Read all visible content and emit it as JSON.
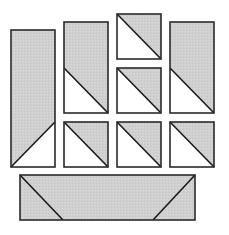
{
  "diagram": {
    "colors": {
      "shaded": "#cfcfcf",
      "light": "#ffffff",
      "stroke": "#2a2a2a"
    },
    "pieces": [
      {
        "id": "tall-rect-left",
        "x": 11,
        "y": 30,
        "w": 44,
        "h": 137,
        "shaded_poly": "11,30 55,30 55,122 11,167",
        "diag": [
          11,
          167,
          55,
          122
        ]
      },
      {
        "id": "rect-col2",
        "x": 64,
        "y": 22,
        "w": 44,
        "h": 91,
        "shaded_poly": "64,22 108,22 108,113 64,68",
        "diag": [
          64,
          68,
          108,
          113
        ]
      },
      {
        "id": "square-col3-top",
        "x": 117,
        "y": 14,
        "w": 44,
        "h": 45,
        "shaded_poly": "117,14 161,14 161,59",
        "diag": [
          117,
          14,
          161,
          59
        ]
      },
      {
        "id": "square-col3-mid",
        "x": 117,
        "y": 68,
        "w": 44,
        "h": 45,
        "shaded_poly": "117,68 161,68 161,113",
        "diag": [
          117,
          68,
          161,
          113
        ]
      },
      {
        "id": "rect-col4",
        "x": 170,
        "y": 22,
        "w": 44,
        "h": 91,
        "shaded_poly": "170,22 214,22 214,113 170,68",
        "diag": [
          170,
          68,
          214,
          113
        ]
      },
      {
        "id": "square-row3-col2",
        "x": 64,
        "y": 122,
        "w": 44,
        "h": 45,
        "shaded_poly": "64,122 108,122 108,167",
        "diag": [
          64,
          122,
          108,
          167
        ]
      },
      {
        "id": "square-row3-col3",
        "x": 117,
        "y": 122,
        "w": 44,
        "h": 45,
        "shaded_poly": "117,122 161,122 161,167",
        "diag": [
          117,
          122,
          161,
          167
        ]
      },
      {
        "id": "square-row3-col4",
        "x": 170,
        "y": 122,
        "w": 44,
        "h": 45,
        "shaded_poly": "170,122 214,122 214,167",
        "diag": [
          170,
          122,
          214,
          167
        ]
      },
      {
        "id": "wide-rect-bottom",
        "x": 20,
        "y": 175,
        "w": 175,
        "h": 45,
        "shaded_poly": "20,175 195,175 195,220 20,220",
        "diag": [
          20,
          175,
          63,
          220
        ],
        "diag2": [
          153,
          220,
          195,
          175
        ]
      }
    ]
  }
}
